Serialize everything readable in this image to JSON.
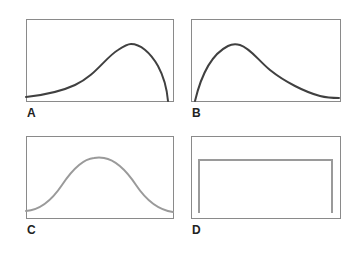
{
  "figure": {
    "panels": [
      {
        "id": "A",
        "label": "A",
        "shape": "left-skewed curve (long left tail, sharp drop on right)",
        "box": {
          "x": 26,
          "y": 19,
          "w": 147,
          "h": 82
        },
        "curve_color": "#404040",
        "label_pos": {
          "x": 27,
          "y": 106
        }
      },
      {
        "id": "B",
        "label": "B",
        "shape": "right-skewed curve (sharp rise on left, long right tail)",
        "box": {
          "x": 191,
          "y": 19,
          "w": 149,
          "h": 82
        },
        "curve_color": "#404040",
        "label_pos": {
          "x": 192,
          "y": 106
        }
      },
      {
        "id": "C",
        "label": "C",
        "shape": "symmetric bell curve",
        "box": {
          "x": 26,
          "y": 136,
          "w": 147,
          "h": 82
        },
        "curve_color": "#9a9a9a",
        "label_pos": {
          "x": 27,
          "y": 223
        }
      },
      {
        "id": "D",
        "label": "D",
        "shape": "uniform / rectangular distribution",
        "box": {
          "x": 191,
          "y": 136,
          "w": 149,
          "h": 82
        },
        "curve_color": "#9a9a9a",
        "label_pos": {
          "x": 192,
          "y": 223
        }
      }
    ],
    "box_color": "#8a8a8a"
  }
}
